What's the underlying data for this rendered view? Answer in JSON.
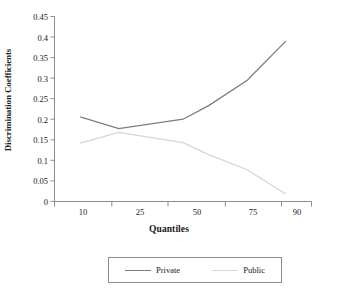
{
  "chart_data": {
    "type": "line",
    "title": "",
    "xlabel": "Quantiles",
    "ylabel": "Discrimination Coefficients",
    "categories": [
      "10",
      "25",
      "50",
      "75",
      "90"
    ],
    "x": [
      10,
      25,
      50,
      75,
      90
    ],
    "xlim": [
      0,
      100
    ],
    "ylim": [
      0,
      0.45
    ],
    "yticks": [
      "0",
      "0.05",
      "0.1",
      "0.15",
      "0.2",
      "0.25",
      "0.3",
      "0.35",
      "0.4",
      "0.45"
    ],
    "ytick_values": [
      0,
      0.05,
      0.1,
      0.15,
      0.2,
      0.25,
      0.3,
      0.35,
      0.4,
      0.45
    ],
    "grid": false,
    "legend_position": "bottom",
    "series": [
      {
        "name": "Private",
        "color": "#7d7d7d",
        "values": [
          0.206,
          0.177,
          0.2,
          0.295,
          0.39
        ],
        "vertices_x": [
          10,
          25,
          50,
          60,
          75,
          90
        ],
        "vertices_y": [
          0.206,
          0.177,
          0.2,
          0.233,
          0.295,
          0.39
        ]
      },
      {
        "name": "Public",
        "color": "#d6d6d6",
        "values": [
          0.142,
          0.168,
          0.143,
          0.077,
          0.018
        ],
        "vertices_x": [
          10,
          25,
          50,
          60,
          75,
          90
        ],
        "vertices_y": [
          0.142,
          0.168,
          0.143,
          0.114,
          0.077,
          0.018
        ]
      }
    ]
  },
  "axes": {
    "ylabel": "Discrimination Coefficients",
    "xlabel": "Quantiles",
    "axis_color": "#8d8d8d"
  },
  "legend": {
    "entries": [
      {
        "label": "Private",
        "color": "#7d7d7d"
      },
      {
        "label": "Public",
        "color": "#d6d6d6"
      }
    ]
  }
}
